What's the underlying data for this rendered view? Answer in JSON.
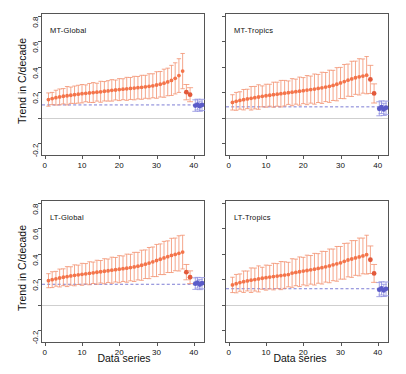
{
  "figure": {
    "width": 406,
    "height": 374,
    "background": "#ffffff",
    "axis_title_y": "Trend in C/decade",
    "axis_title_x": "Data series"
  },
  "colors": {
    "orange": "#F4744A",
    "orange_light": "#F59070",
    "blue": "#5B5BC8",
    "refline": "#6f6fd0",
    "zeroline": "#cfcfcf",
    "frame": "#555555",
    "text": "#111111"
  },
  "chart_data": [
    {
      "type": "scatter",
      "title": "MT-Global",
      "panel": "top-left",
      "xlabel": "Data series",
      "ylabel": "Trend in C/decade",
      "xlim": [
        -1,
        43
      ],
      "ylim": [
        -0.3,
        0.82
      ],
      "xticks": [
        0,
        10,
        20,
        30,
        40
      ],
      "yticks": [
        -0.2,
        0.0,
        0.2,
        0.4,
        0.6,
        0.8
      ],
      "ytick_labels": [
        "-0.2",
        "",
        "0.2",
        "0.4",
        "0.6",
        "0.8"
      ],
      "grid": false,
      "legend": "none",
      "reference_line": 0.1,
      "zero_line": 0.0,
      "series": [
        {
          "name": "model-ensemble",
          "color": "#F4744A",
          "x": [
            1,
            2,
            3,
            4,
            5,
            6,
            7,
            8,
            9,
            10,
            11,
            12,
            13,
            14,
            15,
            16,
            17,
            18,
            19,
            20,
            21,
            22,
            23,
            24,
            25,
            26,
            27,
            28,
            29,
            30,
            31,
            32,
            33,
            34,
            35,
            36,
            37
          ],
          "values": [
            0.142,
            0.15,
            0.157,
            0.163,
            0.168,
            0.172,
            0.176,
            0.18,
            0.184,
            0.188,
            0.191,
            0.194,
            0.197,
            0.2,
            0.203,
            0.207,
            0.21,
            0.214,
            0.217,
            0.22,
            0.223,
            0.226,
            0.229,
            0.232,
            0.235,
            0.238,
            0.242,
            0.246,
            0.25,
            0.256,
            0.262,
            0.27,
            0.28,
            0.292,
            0.308,
            0.33,
            0.365
          ],
          "err_low": [
            0.052,
            0.048,
            0.058,
            0.062,
            0.06,
            0.072,
            0.064,
            0.068,
            0.07,
            0.072,
            0.066,
            0.074,
            0.078,
            0.07,
            0.082,
            0.076,
            0.08,
            0.084,
            0.078,
            0.086,
            0.082,
            0.09,
            0.086,
            0.092,
            0.088,
            0.094,
            0.09,
            0.098,
            0.094,
            0.104,
            0.1,
            0.11,
            0.108,
            0.118,
            0.122,
            0.132,
            0.138
          ],
          "err_high": [
            0.052,
            0.048,
            0.058,
            0.062,
            0.06,
            0.072,
            0.064,
            0.068,
            0.07,
            0.072,
            0.066,
            0.074,
            0.078,
            0.07,
            0.082,
            0.076,
            0.08,
            0.084,
            0.078,
            0.086,
            0.082,
            0.09,
            0.086,
            0.092,
            0.088,
            0.094,
            0.09,
            0.098,
            0.094,
            0.104,
            0.1,
            0.11,
            0.108,
            0.118,
            0.122,
            0.132,
            0.138
          ]
        },
        {
          "name": "reanalysis",
          "color": "#E2593A",
          "x": [
            38,
            39
          ],
          "values": [
            0.2,
            0.18
          ],
          "err_low": [
            0.06,
            0.055
          ],
          "err_high": [
            0.06,
            0.055
          ]
        },
        {
          "name": "satellite-observations",
          "color": "#5B5BC8",
          "x": [
            40.4,
            41.0,
            41.6,
            42.2
          ],
          "values": [
            0.095,
            0.103,
            0.09,
            0.1
          ],
          "err_low": [
            0.045,
            0.042,
            0.04,
            0.044
          ],
          "err_high": [
            0.045,
            0.042,
            0.04,
            0.044
          ]
        }
      ]
    },
    {
      "type": "scatter",
      "title": "MT-Tropics",
      "panel": "top-right",
      "xlabel": "Data series",
      "ylabel": "",
      "xlim": [
        -1,
        43
      ],
      "ylim": [
        -0.3,
        0.82
      ],
      "xticks": [
        0,
        10,
        20,
        30,
        40
      ],
      "yticks": [
        -0.2,
        0.0,
        0.2,
        0.4,
        0.6,
        0.8
      ],
      "ytick_labels": [
        "",
        "",
        "",
        "",
        "",
        ""
      ],
      "grid": false,
      "legend": "none",
      "reference_line": 0.085,
      "zero_line": 0.0,
      "series": [
        {
          "name": "model-ensemble",
          "color": "#F4744A",
          "x": [
            1,
            2,
            3,
            4,
            5,
            6,
            7,
            8,
            9,
            10,
            11,
            12,
            13,
            14,
            15,
            16,
            17,
            18,
            19,
            20,
            21,
            22,
            23,
            24,
            25,
            26,
            27,
            28,
            29,
            30,
            31,
            32,
            33,
            34,
            35,
            36,
            37
          ],
          "values": [
            0.12,
            0.128,
            0.135,
            0.141,
            0.147,
            0.152,
            0.157,
            0.162,
            0.167,
            0.172,
            0.176,
            0.18,
            0.184,
            0.188,
            0.192,
            0.196,
            0.2,
            0.204,
            0.208,
            0.212,
            0.216,
            0.22,
            0.224,
            0.229,
            0.234,
            0.24,
            0.246,
            0.253,
            0.262,
            0.272,
            0.283,
            0.294,
            0.304,
            0.313,
            0.32,
            0.326,
            0.333
          ],
          "err_low": [
            0.06,
            0.07,
            0.068,
            0.08,
            0.076,
            0.092,
            0.088,
            0.096,
            0.082,
            0.09,
            0.086,
            0.098,
            0.094,
            0.104,
            0.1,
            0.092,
            0.106,
            0.098,
            0.11,
            0.102,
            0.114,
            0.106,
            0.118,
            0.11,
            0.122,
            0.114,
            0.126,
            0.118,
            0.13,
            0.122,
            0.134,
            0.126,
            0.138,
            0.13,
            0.142,
            0.134,
            0.146
          ],
          "err_high": [
            0.06,
            0.07,
            0.068,
            0.08,
            0.076,
            0.092,
            0.088,
            0.096,
            0.082,
            0.09,
            0.086,
            0.098,
            0.094,
            0.104,
            0.1,
            0.092,
            0.106,
            0.098,
            0.11,
            0.102,
            0.114,
            0.106,
            0.118,
            0.11,
            0.122,
            0.114,
            0.126,
            0.118,
            0.13,
            0.122,
            0.134,
            0.126,
            0.138,
            0.13,
            0.142,
            0.134,
            0.146
          ]
        },
        {
          "name": "reanalysis",
          "color": "#E2593A",
          "x": [
            38,
            39
          ],
          "values": [
            0.3,
            0.19
          ],
          "err_low": [
            0.11,
            0.075
          ],
          "err_high": [
            0.11,
            0.075
          ]
        },
        {
          "name": "satellite-observations",
          "color": "#5B5BC8",
          "x": [
            40.4,
            41.0,
            41.6,
            42.2
          ],
          "values": [
            0.07,
            0.082,
            0.065,
            0.078
          ],
          "err_low": [
            0.055,
            0.05,
            0.048,
            0.052
          ],
          "err_high": [
            0.055,
            0.05,
            0.048,
            0.052
          ]
        }
      ]
    },
    {
      "type": "scatter",
      "title": "LT-Global",
      "panel": "bottom-left",
      "xlabel": "Data series",
      "ylabel": "Trend in C/decade",
      "xlim": [
        -1,
        43
      ],
      "ylim": [
        -0.3,
        0.82
      ],
      "xticks": [
        0,
        10,
        20,
        30,
        40
      ],
      "yticks": [
        -0.2,
        0.0,
        0.2,
        0.4,
        0.6,
        0.8
      ],
      "ytick_labels": [
        "-0.2",
        "",
        "0.2",
        "0.4",
        "0.6",
        "0.8"
      ],
      "grid": false,
      "legend": "none",
      "reference_line": 0.16,
      "zero_line": 0.0,
      "series": [
        {
          "name": "model-ensemble",
          "color": "#F4744A",
          "x": [
            1,
            2,
            3,
            4,
            5,
            6,
            7,
            8,
            9,
            10,
            11,
            12,
            13,
            14,
            15,
            16,
            17,
            18,
            19,
            20,
            21,
            22,
            23,
            24,
            25,
            26,
            27,
            28,
            29,
            30,
            31,
            32,
            33,
            34,
            35,
            36,
            37
          ],
          "values": [
            0.188,
            0.196,
            0.203,
            0.209,
            0.215,
            0.22,
            0.225,
            0.23,
            0.234,
            0.238,
            0.242,
            0.246,
            0.25,
            0.254,
            0.258,
            0.262,
            0.266,
            0.27,
            0.274,
            0.278,
            0.282,
            0.286,
            0.291,
            0.296,
            0.302,
            0.309,
            0.317,
            0.326,
            0.336,
            0.346,
            0.356,
            0.366,
            0.376,
            0.386,
            0.394,
            0.402,
            0.412
          ],
          "err_low": [
            0.055,
            0.062,
            0.058,
            0.07,
            0.066,
            0.078,
            0.072,
            0.082,
            0.076,
            0.086,
            0.08,
            0.09,
            0.084,
            0.094,
            0.088,
            0.098,
            0.092,
            0.102,
            0.096,
            0.106,
            0.1,
            0.11,
            0.104,
            0.114,
            0.108,
            0.118,
            0.112,
            0.122,
            0.116,
            0.126,
            0.12,
            0.13,
            0.124,
            0.134,
            0.128,
            0.138,
            0.132
          ],
          "err_high": [
            0.055,
            0.062,
            0.058,
            0.07,
            0.066,
            0.078,
            0.072,
            0.082,
            0.076,
            0.086,
            0.08,
            0.09,
            0.084,
            0.094,
            0.088,
            0.098,
            0.092,
            0.102,
            0.096,
            0.106,
            0.1,
            0.11,
            0.104,
            0.114,
            0.108,
            0.118,
            0.112,
            0.122,
            0.116,
            0.126,
            0.12,
            0.13,
            0.124,
            0.134,
            0.128,
            0.138,
            0.132
          ]
        },
        {
          "name": "reanalysis",
          "color": "#E2593A",
          "x": [
            38,
            39
          ],
          "values": [
            0.255,
            0.215
          ],
          "err_low": [
            0.06,
            0.05
          ],
          "err_high": [
            0.06,
            0.05
          ]
        },
        {
          "name": "satellite-observations",
          "color": "#5B5BC8",
          "x": [
            40.4,
            41.0,
            41.6,
            42.2
          ],
          "values": [
            0.165,
            0.172,
            0.158,
            0.168
          ],
          "err_low": [
            0.045,
            0.042,
            0.04,
            0.044
          ],
          "err_high": [
            0.045,
            0.042,
            0.04,
            0.044
          ]
        }
      ]
    },
    {
      "type": "scatter",
      "title": "LT-Tropics",
      "panel": "bottom-right",
      "xlabel": "Data series",
      "ylabel": "",
      "xlim": [
        -1,
        43
      ],
      "ylim": [
        -0.3,
        0.82
      ],
      "xticks": [
        0,
        10,
        20,
        30,
        40
      ],
      "yticks": [
        -0.2,
        0.0,
        0.2,
        0.4,
        0.6,
        0.8
      ],
      "ytick_labels": [
        "",
        "",
        "",
        "",
        "",
        ""
      ],
      "grid": false,
      "legend": "none",
      "reference_line": 0.125,
      "zero_line": 0.0,
      "series": [
        {
          "name": "model-ensemble",
          "color": "#F4744A",
          "x": [
            1,
            2,
            3,
            4,
            5,
            6,
            7,
            8,
            9,
            10,
            11,
            12,
            13,
            14,
            15,
            16,
            17,
            18,
            19,
            20,
            21,
            22,
            23,
            24,
            25,
            26,
            27,
            28,
            29,
            30,
            31,
            32,
            33,
            34,
            35,
            36,
            37
          ],
          "values": [
            0.155,
            0.165,
            0.173,
            0.18,
            0.186,
            0.192,
            0.197,
            0.202,
            0.207,
            0.212,
            0.216,
            0.22,
            0.224,
            0.228,
            0.232,
            0.236,
            0.248,
            0.253,
            0.258,
            0.263,
            0.268,
            0.273,
            0.278,
            0.284,
            0.29,
            0.297,
            0.304,
            0.312,
            0.32,
            0.328,
            0.34,
            0.35,
            0.358,
            0.366,
            0.374,
            0.382,
            0.392
          ],
          "err_low": [
            0.06,
            0.072,
            0.068,
            0.084,
            0.078,
            0.096,
            0.09,
            0.102,
            0.086,
            0.098,
            0.092,
            0.104,
            0.098,
            0.11,
            0.104,
            0.096,
            0.112,
            0.104,
            0.116,
            0.108,
            0.12,
            0.112,
            0.124,
            0.116,
            0.128,
            0.12,
            0.132,
            0.124,
            0.136,
            0.128,
            0.14,
            0.132,
            0.144,
            0.136,
            0.148,
            0.14,
            0.152
          ],
          "err_high": [
            0.06,
            0.072,
            0.068,
            0.084,
            0.078,
            0.096,
            0.09,
            0.102,
            0.086,
            0.098,
            0.092,
            0.104,
            0.098,
            0.11,
            0.104,
            0.096,
            0.112,
            0.104,
            0.116,
            0.108,
            0.12,
            0.112,
            0.124,
            0.116,
            0.128,
            0.12,
            0.132,
            0.124,
            0.136,
            0.128,
            0.14,
            0.132,
            0.144,
            0.136,
            0.148,
            0.14,
            0.152
          ]
        },
        {
          "name": "reanalysis",
          "color": "#E2593A",
          "x": [
            38,
            39
          ],
          "values": [
            0.352,
            0.245
          ],
          "err_low": [
            0.108,
            0.07
          ],
          "err_high": [
            0.108,
            0.07
          ]
        },
        {
          "name": "satellite-observations",
          "color": "#5B5BC8",
          "x": [
            40.4,
            41.0,
            41.6,
            42.2
          ],
          "values": [
            0.118,
            0.128,
            0.112,
            0.124
          ],
          "err_low": [
            0.055,
            0.052,
            0.048,
            0.054
          ],
          "err_high": [
            0.055,
            0.052,
            0.048,
            0.054
          ]
        }
      ]
    }
  ]
}
